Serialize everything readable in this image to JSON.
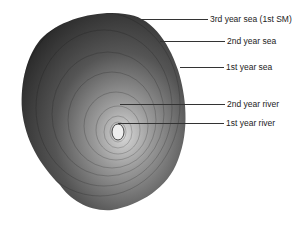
{
  "figure": {
    "labels": [
      {
        "text": "3rd year sea (1st SM)",
        "y": 19,
        "line_x1": 140,
        "line_x2": 208
      },
      {
        "text": "2nd year sea",
        "y": 41,
        "line_x1": 160,
        "line_x2": 225
      },
      {
        "text": "1st year sea",
        "y": 67,
        "line_x1": 180,
        "line_x2": 224
      },
      {
        "text": "2nd year river",
        "y": 104,
        "line_x1": 120,
        "line_x2": 225
      },
      {
        "text": "1st year river",
        "y": 123,
        "line_x1": 118,
        "line_x2": 224
      }
    ]
  }
}
